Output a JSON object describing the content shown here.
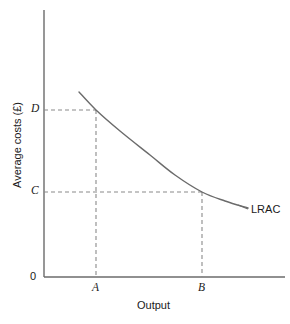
{
  "chart_data": {
    "type": "line",
    "title": "",
    "xlabel": "Output",
    "ylabel": "Average costs (£)",
    "grid": false,
    "legend": "none",
    "origin_label": "0",
    "x_tick_labels": [
      "A",
      "B"
    ],
    "y_tick_labels": [
      "C",
      "D"
    ],
    "series": [
      {
        "name": "LRAC",
        "label": "LRAC",
        "description": "Long run average cost curve, downward sloping and convex, flattening at higher output",
        "points": [
          {
            "x": 79,
            "y": 92
          },
          {
            "x": 96,
            "y": 110
          },
          {
            "x": 120,
            "y": 131
          },
          {
            "x": 150,
            "y": 155
          },
          {
            "x": 175,
            "y": 175
          },
          {
            "x": 202,
            "y": 192
          },
          {
            "x": 225,
            "y": 201
          },
          {
            "x": 248,
            "y": 208
          }
        ]
      }
    ],
    "annotations": [
      {
        "name": "guide-D-to-A",
        "type": "dashed",
        "from": "y-axis at D",
        "to": "curve at output A"
      },
      {
        "name": "guide-A-to-axis",
        "type": "dashed",
        "from": "curve at output A",
        "to": "x-axis at A"
      },
      {
        "name": "guide-C-to-B",
        "type": "dashed",
        "from": "y-axis at C",
        "to": "curve at output B"
      },
      {
        "name": "guide-B-to-axis",
        "type": "dashed",
        "from": "curve at output B",
        "to": "x-axis at B"
      }
    ],
    "axis_ranges": {
      "x_pixels": [
        44,
        285
      ],
      "y_pixels": [
        277,
        10
      ]
    },
    "markers": {
      "A_x_px": 96,
      "B_x_px": 202,
      "C_y_px": 192,
      "D_y_px": 110
    },
    "colors": {
      "axis": "#6b6b6b",
      "curve": "#6b6b6b",
      "guide": "#8a8a8a",
      "text": "#1a1a1a",
      "background": "#ffffff"
    }
  }
}
